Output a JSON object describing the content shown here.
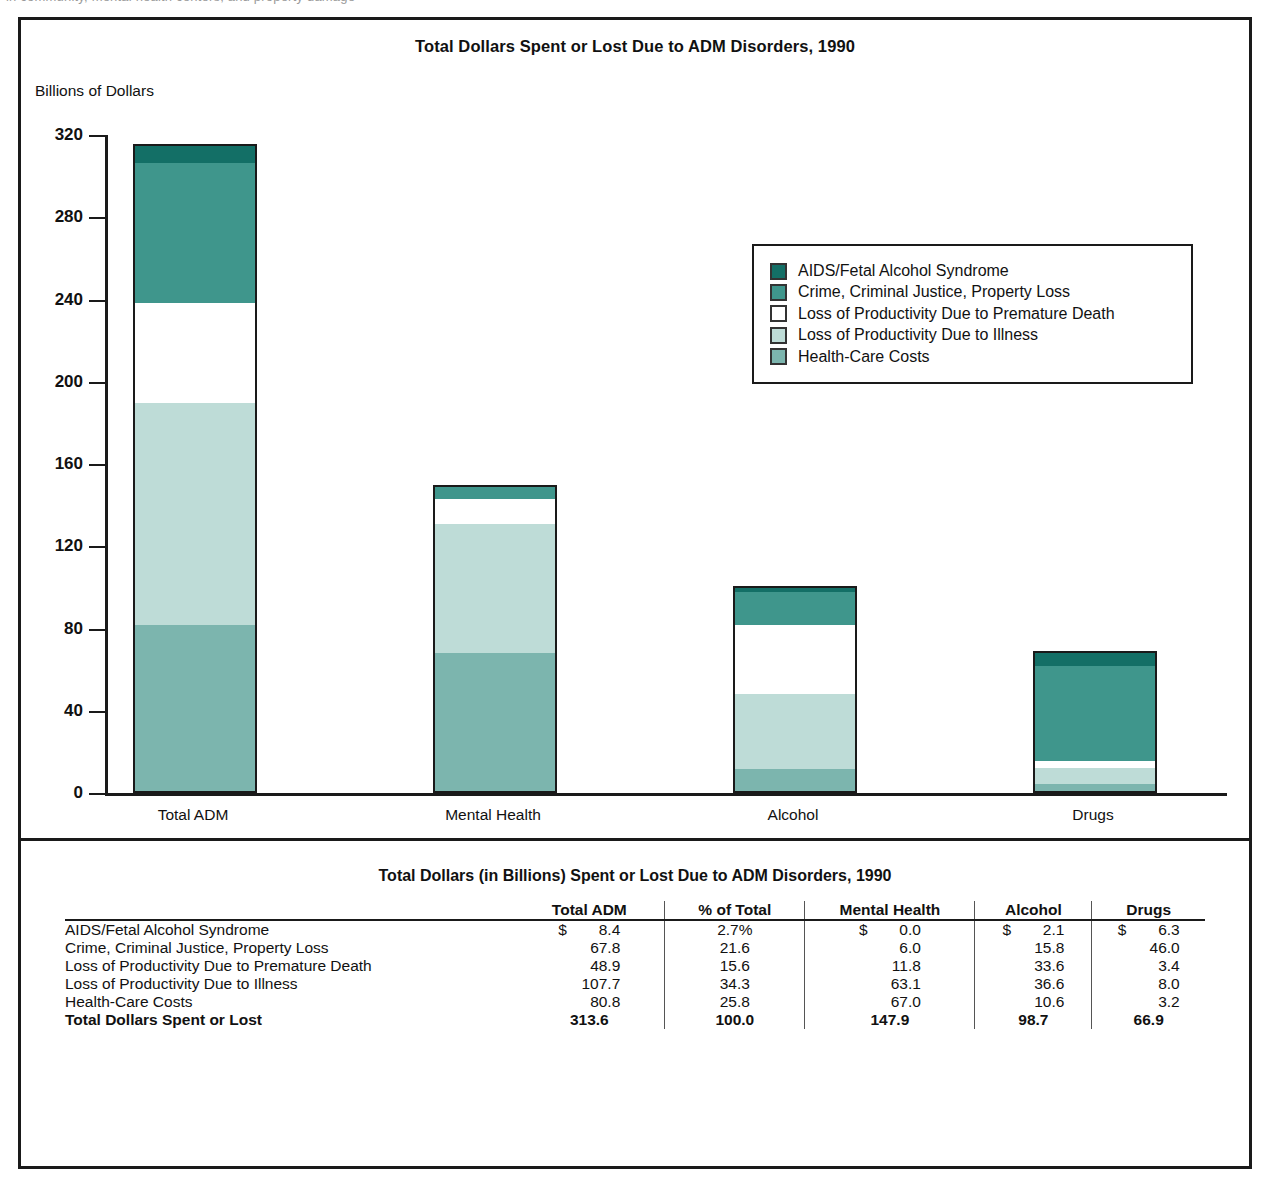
{
  "page_top_sliver": "in community, mental health centers, and property damage",
  "chart_data": {
    "type": "bar",
    "stacked": true,
    "title": "Total Dollars Spent or Lost Due to ADM Disorders, 1990",
    "ylabel": "Billions of Dollars",
    "xlabel": "",
    "ylim": [
      0,
      320
    ],
    "yticks": [
      0,
      40,
      80,
      120,
      160,
      200,
      240,
      280,
      320
    ],
    "grid": false,
    "legend_position": "upper-right-inset",
    "categories": [
      "Total ADM",
      "Mental Health",
      "Alcohol",
      "Drugs"
    ],
    "series": [
      {
        "name": "Health-Care Costs",
        "color": "#7cb5ae",
        "values": [
          80.8,
          67.0,
          10.6,
          3.2
        ]
      },
      {
        "name": "Loss of Productivity Due to Illness",
        "color": "#bedcd7",
        "values": [
          107.7,
          63.1,
          36.6,
          8.0
        ]
      },
      {
        "name": "Loss of Productivity Due to Premature Death",
        "color": "#ffffff",
        "values": [
          48.9,
          11.8,
          33.6,
          3.4
        ]
      },
      {
        "name": "Crime, Criminal Justice, Property Loss",
        "color": "#3f968c",
        "values": [
          67.8,
          6.0,
          15.8,
          46.0
        ]
      },
      {
        "name": "AIDS/Fetal Alcohol Syndrome",
        "color": "#136f66",
        "values": [
          8.4,
          0.0,
          2.1,
          6.3
        ]
      }
    ],
    "totals": [
      313.6,
      147.9,
      98.7,
      66.9
    ]
  },
  "legend": {
    "items": [
      {
        "label": "AIDS/Fetal Alcohol Syndrome",
        "color": "#136f66"
      },
      {
        "label": "Crime, Criminal Justice, Property Loss",
        "color": "#3f968c"
      },
      {
        "label": "Loss of Productivity Due to Premature Death",
        "color": "#ffffff"
      },
      {
        "label": "Loss of Productivity Due to Illness",
        "color": "#bedcd7"
      },
      {
        "label": "Health-Care Costs",
        "color": "#7cb5ae"
      }
    ]
  },
  "table": {
    "title": "Total Dollars (in Billions) Spent or Lost Due to ADM Disorders, 1990",
    "headers": [
      "",
      "Total ADM",
      "% of Total",
      "Mental Health",
      "Alcohol",
      "Drugs"
    ],
    "rows": [
      {
        "label": "AIDS/Fetal Alcohol Syndrome",
        "total_adm": "8.4",
        "total_adm_sign": "$",
        "pct": "2.7%",
        "mental_health": "0.0",
        "mental_health_sign": "$",
        "alcohol": "2.1",
        "alcohol_sign": "$",
        "drugs": "6.3",
        "drugs_sign": "$"
      },
      {
        "label": "Crime, Criminal Justice, Property Loss",
        "total_adm": "67.8",
        "total_adm_sign": "",
        "pct": "21.6",
        "mental_health": "6.0",
        "mental_health_sign": "",
        "alcohol": "15.8",
        "alcohol_sign": "",
        "drugs": "46.0",
        "drugs_sign": ""
      },
      {
        "label": "Loss of Productivity Due to Premature Death",
        "total_adm": "48.9",
        "total_adm_sign": "",
        "pct": "15.6",
        "mental_health": "11.8",
        "mental_health_sign": "",
        "alcohol": "33.6",
        "alcohol_sign": "",
        "drugs": "3.4",
        "drugs_sign": ""
      },
      {
        "label": "Loss of Productivity Due to Illness",
        "total_adm": "107.7",
        "total_adm_sign": "",
        "pct": "34.3",
        "mental_health": "63.1",
        "mental_health_sign": "",
        "alcohol": "36.6",
        "alcohol_sign": "",
        "drugs": "8.0",
        "drugs_sign": ""
      },
      {
        "label": "Health-Care Costs",
        "total_adm": "80.8",
        "total_adm_sign": "",
        "pct": "25.8",
        "mental_health": "67.0",
        "mental_health_sign": "",
        "alcohol": "10.6",
        "alcohol_sign": "",
        "drugs": "3.2",
        "drugs_sign": ""
      }
    ],
    "total_row": {
      "label": "Total Dollars Spent or Lost",
      "total_adm": "313.6",
      "pct": "100.0",
      "mental_health": "147.9",
      "alcohol": "98.7",
      "drugs": "66.9"
    }
  }
}
